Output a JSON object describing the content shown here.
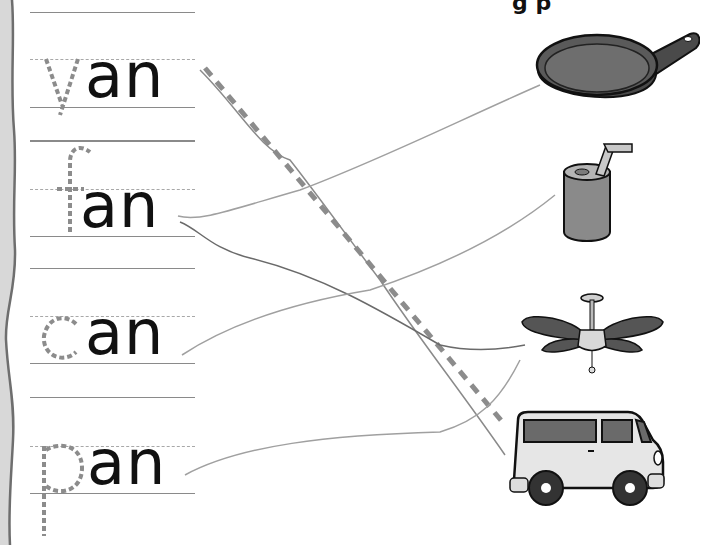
{
  "worksheet": {
    "header_partial": "g p",
    "words": [
      {
        "id": "van",
        "traced_letter": "v",
        "rest": "an",
        "word": "van"
      },
      {
        "id": "fan",
        "traced_letter": "f",
        "rest": "an",
        "word": "fan"
      },
      {
        "id": "can",
        "traced_letter": "c",
        "rest": "an",
        "word": "can"
      },
      {
        "id": "pan",
        "traced_letter": "p",
        "rest": "an",
        "word": "pan"
      }
    ],
    "pictures": [
      {
        "id": "pan",
        "label": "frying pan"
      },
      {
        "id": "can",
        "label": "soda can with straw"
      },
      {
        "id": "fan",
        "label": "ceiling fan"
      },
      {
        "id": "van",
        "label": "van"
      }
    ],
    "connections": [
      {
        "from": "van",
        "to": "van",
        "style": "dashed-example"
      },
      {
        "from": "fan",
        "to": "pan"
      },
      {
        "from": "fan",
        "to": "fan"
      },
      {
        "from": "can",
        "to": "can"
      },
      {
        "from": "pan",
        "to": "fan"
      }
    ],
    "colors": {
      "ink": "#111111",
      "trace": "#8c8c8c",
      "guide_line": "#8a8a8a",
      "pencil_line": "#9a9a9a",
      "torn_edge": "#cfcfcf"
    }
  }
}
